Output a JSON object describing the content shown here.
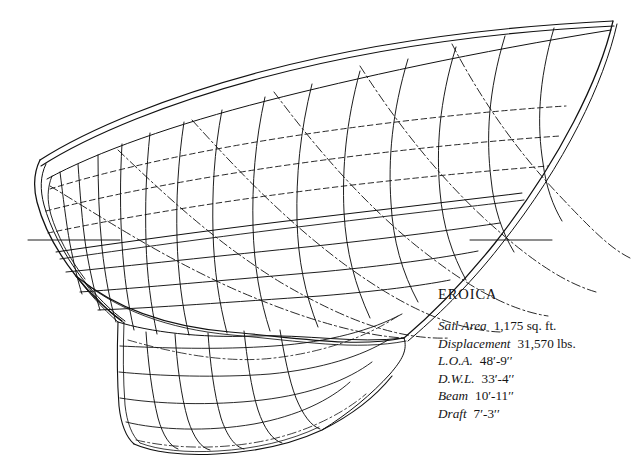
{
  "drawing": {
    "title": "EROICA",
    "subject": "sailboat-hull-lines-perspective",
    "view": "perspective lines plan, bow to the right, stern to the left",
    "background_color": "#ffffff",
    "line_color": "#111111",
    "line_styles": {
      "sheer_and_profile": "solid",
      "stations": "solid",
      "waterlines": "dashed",
      "diagonals": "dash-dot"
    }
  },
  "specs": {
    "name": "EROICA",
    "rows": [
      {
        "label": "Sail Area",
        "value": "1,175 sq. ft."
      },
      {
        "label": "Displacement",
        "value": "31,570 lbs."
      },
      {
        "label": "L.O.A.",
        "value": "48′-9′′"
      },
      {
        "label": "D.W.L.",
        "value": "33′-4′′"
      },
      {
        "label": "Beam",
        "value": "10′-11′′"
      },
      {
        "label": "Draft",
        "value": "7′-3′′"
      }
    ]
  }
}
